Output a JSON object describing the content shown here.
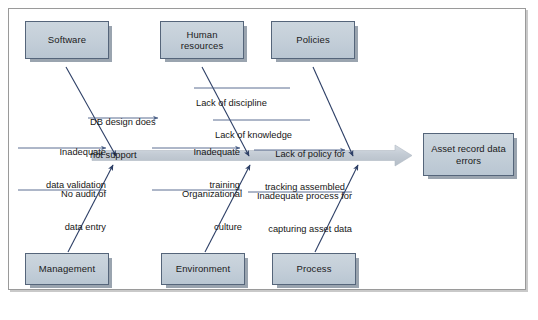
{
  "diagram": {
    "type": "fishbone-ishikawa",
    "effect": {
      "label": "Asset record data\nerrors",
      "line1": "Asset record data",
      "line2": "errors"
    },
    "spine": {
      "color": "#c5ccd4",
      "direction": "left-to-right"
    },
    "categories": [
      {
        "id": "software",
        "label": "Software",
        "position": "top",
        "causes": [
          {
            "id": "db-design",
            "text": "DB design does\nnot support",
            "line1": "DB design does",
            "line2": "not support"
          },
          {
            "id": "inadequate-data-validation",
            "text": "Inadequate\ndata validation",
            "line1": "Inadequate",
            "line2": "data validation"
          }
        ]
      },
      {
        "id": "human-resources",
        "label": "Human\nresources",
        "line1": "Human",
        "line2": "resources",
        "position": "top",
        "causes": [
          {
            "id": "lack-of-discipline",
            "text": "Lack of discipline",
            "line1": "Lack of discipline",
            "line2": ""
          },
          {
            "id": "lack-of-knowledge",
            "text": "Lack of knowledge",
            "line1": "Lack of knowledge",
            "line2": ""
          },
          {
            "id": "inadequate-training",
            "text": "Inadequate\ntraining",
            "line1": "Inadequate",
            "line2": "training"
          }
        ]
      },
      {
        "id": "policies",
        "label": "Policies",
        "position": "top",
        "causes": [
          {
            "id": "lack-of-policy-tracking",
            "text": "Lack of policy for\ntracking assembled",
            "line1": "Lack of policy for",
            "line2": "tracking assembled"
          }
        ]
      },
      {
        "id": "management",
        "label": "Management",
        "position": "bottom",
        "causes": [
          {
            "id": "no-audit-data-entry",
            "text": "No audit of\ndata entry",
            "line1": "No audit of",
            "line2": "data entry"
          }
        ]
      },
      {
        "id": "environment",
        "label": "Environment",
        "position": "bottom",
        "causes": [
          {
            "id": "organizational-culture",
            "text": "Organizational\nculture",
            "line1": "Organizational",
            "line2": "culture"
          }
        ]
      },
      {
        "id": "process",
        "label": "Process",
        "position": "bottom",
        "causes": [
          {
            "id": "inadequate-capture-process",
            "text": "Inadequate process for\ncapturing asset data",
            "line1": "Inadequate process for",
            "line2": "capturing asset data"
          }
        ]
      }
    ],
    "colors": {
      "box_fill": "#c6d0da",
      "box_border": "#55657a",
      "box_shadow": "#8b97a5",
      "bone_line": "#2d3f66",
      "spine": "#c5ccd4",
      "underline": "#4a5f86",
      "frame_border": "#9a9a9a",
      "text": "#161616",
      "background": "#ffffff"
    }
  }
}
